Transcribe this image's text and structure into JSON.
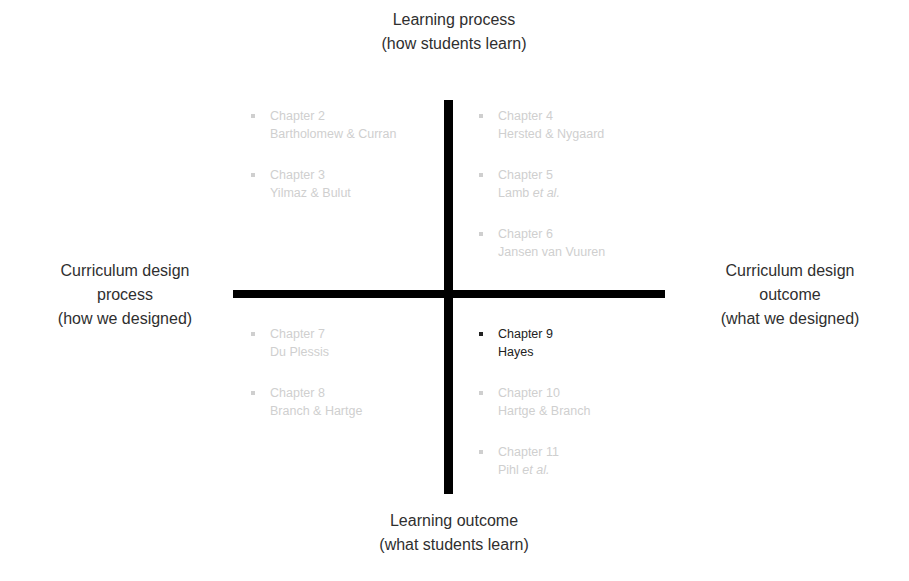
{
  "diagram": {
    "type": "quadrant",
    "colors": {
      "axis": "#000000",
      "label_text": "#2f2f2f",
      "faded_text": "#cfcfcf",
      "highlight_text": "#222222"
    },
    "axes": {
      "top": {
        "line1": "Learning process",
        "line2": "(how students learn)"
      },
      "bottom": {
        "line1": "Learning outcome",
        "line2": "(what students learn)"
      },
      "left": {
        "line1": "Curriculum design",
        "line2": "process",
        "line3": "(how we designed)"
      },
      "right": {
        "line1": "Curriculum design",
        "line2": "outcome",
        "line3": "(what we designed)"
      }
    },
    "quadrants": {
      "top_left": [
        {
          "chapter": "Chapter 2",
          "authors": "Bartholomew & Curran",
          "etal": ""
        },
        {
          "chapter": "Chapter 3",
          "authors": "Yilmaz & Bulut",
          "etal": ""
        }
      ],
      "top_right": [
        {
          "chapter": "Chapter 4",
          "authors": "Hersted & Nygaard",
          "etal": ""
        },
        {
          "chapter": "Chapter 5",
          "authors": "Lamb ",
          "etal": "et al."
        },
        {
          "chapter": "Chapter 6",
          "authors": "Jansen van Vuuren",
          "etal": ""
        }
      ],
      "bottom_left": [
        {
          "chapter": "Chapter 7",
          "authors": "Du Plessis",
          "etal": ""
        },
        {
          "chapter": "Chapter 8",
          "authors": "Branch & Hartge",
          "etal": ""
        }
      ],
      "bottom_right": [
        {
          "chapter": "Chapter 9",
          "authors": "Hayes",
          "etal": "",
          "highlighted": true
        },
        {
          "chapter": "Chapter 10",
          "authors": "Hartge & Branch",
          "etal": ""
        },
        {
          "chapter": "Chapter 11",
          "authors": "Pihl ",
          "etal": "et al."
        }
      ]
    }
  }
}
